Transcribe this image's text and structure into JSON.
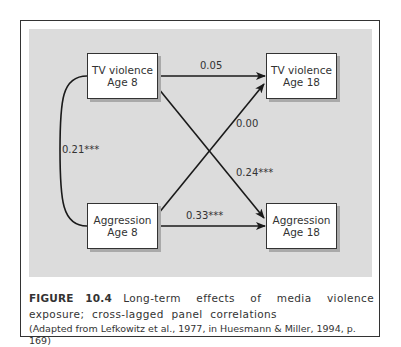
{
  "figure": {
    "number_label": "FIGURE 10.4",
    "title": "Long-term effects of media violence exposure; cross-lagged panel correlations",
    "source": "(Adapted from Lefkowitz et al., 1977, in Huesmann & Miller, 1994, p. 169)"
  },
  "nodes": {
    "tv_violence_age8": {
      "line1": "TV violence",
      "line2": "Age 8"
    },
    "tv_violence_age18": {
      "line1": "TV violence",
      "line2": "Age 18"
    },
    "aggression_age8": {
      "line1": "Aggression",
      "line2": "Age 8"
    },
    "aggression_age18": {
      "line1": "Aggression",
      "line2": "Age 18"
    }
  },
  "edges": {
    "tv8_to_tv18": {
      "label": "0.05",
      "type": "arrow"
    },
    "agg8_to_tv18": {
      "label": "0.00",
      "type": "arrow"
    },
    "tv8_to_agg18": {
      "label": "0.24***",
      "type": "arrow"
    },
    "agg8_to_agg18": {
      "label": "0.33***",
      "type": "arrow"
    },
    "tv8_agg8_correlation": {
      "label": "0.21***",
      "type": "curved-line"
    }
  },
  "colors": {
    "panel_background": "#dcdcdc",
    "node_background": "#ffffff",
    "line": "#1a1a1a",
    "node_shadow": "#a9a9a9"
  }
}
